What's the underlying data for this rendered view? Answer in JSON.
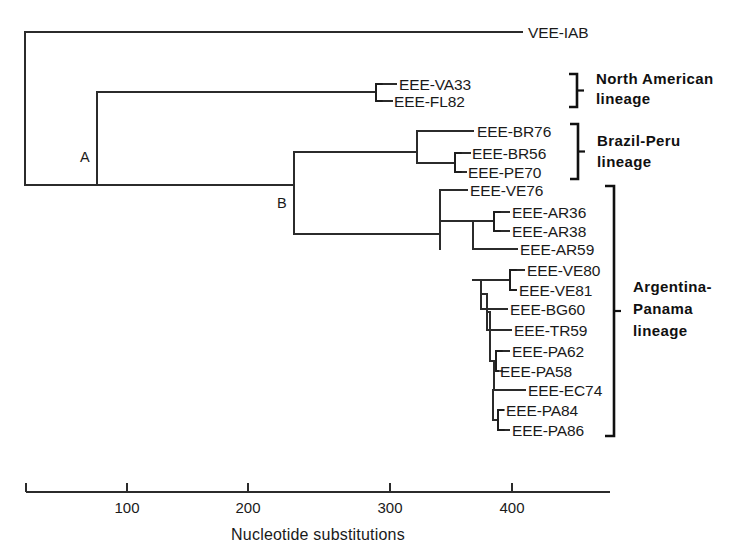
{
  "figure": {
    "kind": "phylogenetic-tree",
    "background_color": "#ffffff",
    "line_color": "#2b2b2b",
    "text_color": "#1a1a1a"
  },
  "chart_data": {
    "type": "tree",
    "title": "",
    "xlabel": "Nucleotide  substitutions",
    "ylabel": "",
    "grid": false,
    "legend_position": "right-brackets",
    "axis": {
      "ticks": [
        100,
        200,
        300,
        400
      ],
      "tick_labels": [
        "100",
        "200",
        "300",
        "400"
      ],
      "range": [
        0,
        470
      ],
      "units": "nucleotide substitutions"
    },
    "internal_node_labels": [
      "A",
      "B"
    ],
    "taxa": [
      "VEE-IAB",
      "EEE-VA33",
      "EEE-FL82",
      "EEE-BR76",
      "EEE-BR56",
      "EEE-PE70",
      "EEE-VE76",
      "EEE-AR36",
      "EEE-AR38",
      "EEE-AR59",
      "EEE-VE80",
      "EEE-VE81",
      "EEE-BG60",
      "EEE-TR59",
      "EEE-PA62",
      "EEE-PA58",
      "EEE-EC74",
      "EEE-PA84",
      "EEE-PA86"
    ],
    "groups": [
      {
        "name": "North American lineage",
        "members": [
          "EEE-VA33",
          "EEE-FL82"
        ]
      },
      {
        "name": "Brazil-Peru lineage",
        "members": [
          "EEE-BR76",
          "EEE-BR56",
          "EEE-PE70"
        ]
      },
      {
        "name": "Argentina-Panama lineage",
        "members": [
          "EEE-VE76",
          "EEE-AR36",
          "EEE-AR38",
          "EEE-AR59",
          "EEE-VE80",
          "EEE-VE81",
          "EEE-BG60",
          "EEE-TR59",
          "EEE-PA62",
          "EEE-PA58",
          "EEE-EC74",
          "EEE-PA84",
          "EEE-PA86"
        ]
      }
    ]
  },
  "tips": [
    {
      "id": "vee-iab",
      "label": "VEE-IAB",
      "label_x": 528,
      "y": 32,
      "branch_from": 25,
      "branch_to": 522
    },
    {
      "id": "eee-va33",
      "label": "EEE-VA33",
      "label_x": 399,
      "y": 84,
      "branch_from": 376,
      "branch_to": 396
    },
    {
      "id": "eee-fl82",
      "label": "EEE-FL82",
      "label_x": 394,
      "y": 101,
      "branch_from": 376,
      "branch_to": 392
    },
    {
      "id": "eee-br76",
      "label": "EEE-BR76",
      "label_x": 477,
      "y": 131,
      "branch_from": 417,
      "branch_to": 473
    },
    {
      "id": "eee-br56",
      "label": "EEE-BR56",
      "label_x": 472,
      "y": 153,
      "branch_from": 455,
      "branch_to": 470
    },
    {
      "id": "eee-pe70",
      "label": "EEE-PE70",
      "label_x": 468,
      "y": 172,
      "branch_from": 455,
      "branch_to": 466
    },
    {
      "id": "eee-ve76",
      "label": "EEE-VE76",
      "label_x": 470,
      "y": 190,
      "branch_from": 440,
      "branch_to": 467
    },
    {
      "id": "eee-ar36",
      "label": "EEE-AR36",
      "label_x": 512,
      "y": 212,
      "branch_from": 494,
      "branch_to": 509
    },
    {
      "id": "eee-ar38",
      "label": "EEE-AR38",
      "label_x": 512,
      "y": 231,
      "branch_from": 494,
      "branch_to": 509
    },
    {
      "id": "eee-ar59",
      "label": "EEE-AR59",
      "label_x": 520,
      "y": 249,
      "branch_from": 473,
      "branch_to": 517
    },
    {
      "id": "eee-ve80",
      "label": "EEE-VE80",
      "label_x": 527,
      "y": 270,
      "branch_from": 510,
      "branch_to": 524
    },
    {
      "id": "eee-ve81",
      "label": "EEE-VE81",
      "label_x": 519,
      "y": 290,
      "branch_from": 510,
      "branch_to": 516
    },
    {
      "id": "eee-bg60",
      "label": "EEE-BG60",
      "label_x": 510,
      "y": 309,
      "branch_from": 481,
      "branch_to": 507
    },
    {
      "id": "eee-tr59",
      "label": "EEE-TR59",
      "label_x": 514,
      "y": 330,
      "branch_from": 487,
      "branch_to": 511
    },
    {
      "id": "eee-pa62",
      "label": "EEE-PA62",
      "label_x": 512,
      "y": 351,
      "branch_from": 496,
      "branch_to": 509
    },
    {
      "id": "eee-pa58",
      "label": "EEE-PA58",
      "label_x": 500,
      "y": 371,
      "branch_from": 496,
      "branch_to": 498
    },
    {
      "id": "eee-ec74",
      "label": "EEE-EC74",
      "label_x": 528,
      "y": 390,
      "branch_from": 494,
      "branch_to": 525
    },
    {
      "id": "eee-pa84",
      "label": "EEE-PA84",
      "label_x": 506,
      "y": 410,
      "branch_from": 498,
      "branch_to": 503
    },
    {
      "id": "eee-pa86",
      "label": "EEE-PA86",
      "label_x": 512,
      "y": 430,
      "branch_from": 498,
      "branch_to": 509
    }
  ],
  "internal_nodes": [
    {
      "id": "root",
      "x": 25,
      "y_top": 32,
      "y_bottom": 185,
      "label": "",
      "label_x": 0,
      "label_y": 0
    },
    {
      "id": "node-a",
      "x": 97,
      "y_top": 92,
      "y_bottom": 185,
      "label": "A",
      "label_x": 80,
      "label_y": 162
    },
    {
      "id": "node-b",
      "x": 294,
      "y_top": 152,
      "y_bottom": 234,
      "label": "B",
      "label_x": 277,
      "label_y": 208
    },
    {
      "id": "node-na",
      "x": 376,
      "y_top": 84,
      "y_bottom": 101,
      "label": "",
      "label_x": 0,
      "label_y": 0
    },
    {
      "id": "node-bp",
      "x": 417,
      "y_top": 131,
      "y_bottom": 163,
      "label": "",
      "label_x": 0,
      "label_y": 0
    },
    {
      "id": "node-brpe",
      "x": 455,
      "y_top": 153,
      "y_bottom": 172,
      "label": "",
      "label_x": 0,
      "label_y": 0
    },
    {
      "id": "node-ap1",
      "x": 440,
      "y_top": 190,
      "y_bottom": 249,
      "label": "",
      "label_x": 0,
      "label_y": 0
    },
    {
      "id": "node-ap2",
      "x": 473,
      "y_top": 221,
      "y_bottom": 249,
      "label": "",
      "label_x": 0,
      "label_y": 0
    },
    {
      "id": "node-ar",
      "x": 494,
      "y_top": 212,
      "y_bottom": 231,
      "label": "",
      "label_x": 0,
      "label_y": 0
    },
    {
      "id": "node-ap3",
      "x": 481,
      "y_top": 280,
      "y_bottom": 309,
      "label": "",
      "label_x": 0,
      "label_y": 0
    },
    {
      "id": "node-ve",
      "x": 510,
      "y_top": 270,
      "y_bottom": 290,
      "label": "",
      "label_x": 0,
      "label_y": 0
    },
    {
      "id": "node-ap4",
      "x": 487,
      "y_top": 294,
      "y_bottom": 330,
      "label": "",
      "label_x": 0,
      "label_y": 0
    },
    {
      "id": "node-ap5",
      "x": 490,
      "y_top": 312,
      "y_bottom": 361,
      "label": "",
      "label_x": 0,
      "label_y": 0
    },
    {
      "id": "node-pa1",
      "x": 496,
      "y_top": 351,
      "y_bottom": 371,
      "label": "",
      "label_x": 0,
      "label_y": 0
    },
    {
      "id": "node-ap6",
      "x": 494,
      "y_top": 361,
      "y_bottom": 390,
      "label": "",
      "label_x": 0,
      "label_y": 0
    },
    {
      "id": "node-ap7",
      "x": 493,
      "y_top": 390,
      "y_bottom": 420,
      "label": "",
      "label_x": 0,
      "label_y": 0
    },
    {
      "id": "node-pa2",
      "x": 498,
      "y_top": 410,
      "y_bottom": 430,
      "label": "",
      "label_x": 0,
      "label_y": 0
    }
  ],
  "connectors": [
    {
      "id": "root-to-a",
      "x_from": 25,
      "x_to": 97,
      "y": 185
    },
    {
      "id": "a-to-na",
      "x_from": 97,
      "x_to": 376,
      "y": 92
    },
    {
      "id": "a-to-b",
      "x_from": 97,
      "x_to": 294,
      "y": 185
    },
    {
      "id": "b-to-bp",
      "x_from": 294,
      "x_to": 417,
      "y": 152
    },
    {
      "id": "bp-to-brpe",
      "x_from": 417,
      "x_to": 455,
      "y": 163
    },
    {
      "id": "b-to-ap1",
      "x_from": 294,
      "x_to": 440,
      "y": 234
    },
    {
      "id": "ap1-to-ap2",
      "x_from": 440,
      "x_to": 473,
      "y": 221
    },
    {
      "id": "ap2-to-ar",
      "x_from": 473,
      "x_to": 494,
      "y": 221
    },
    {
      "id": "ap2-to-ap3",
      "x_from": 473,
      "x_to": 481,
      "y": 280
    },
    {
      "id": "ap3-to-ve",
      "x_from": 481,
      "x_to": 510,
      "y": 280
    },
    {
      "id": "ap3-to-ap4",
      "x_from": 481,
      "x_to": 487,
      "y": 294
    },
    {
      "id": "ap4-to-ap5",
      "x_from": 487,
      "x_to": 490,
      "y": 312
    },
    {
      "id": "ap5-to-pa1",
      "x_from": 490,
      "x_to": 496,
      "y": 361
    },
    {
      "id": "pa1-to-ap6",
      "x_from": 494,
      "x_to": 496,
      "y": 361
    },
    {
      "id": "ap6-to-ap7",
      "x_from": 493,
      "x_to": 494,
      "y": 390
    },
    {
      "id": "ap7-to-pa2",
      "x_from": 493,
      "x_to": 498,
      "y": 420
    }
  ],
  "clade_brackets": [
    {
      "id": "bracket-na",
      "x": 376,
      "y_top": 84,
      "y_bottom": 101,
      "tick": 6
    },
    {
      "id": "bracket-brpe",
      "x": 455,
      "y_top": 153,
      "y_bottom": 172,
      "tick": 6
    },
    {
      "id": "bracket-ar",
      "x": 494,
      "y_top": 212,
      "y_bottom": 231,
      "tick": 6
    },
    {
      "id": "bracket-ve",
      "x": 510,
      "y_top": 270,
      "y_bottom": 290,
      "tick": 6
    },
    {
      "id": "bracket-pa62",
      "x": 496,
      "y_top": 351,
      "y_bottom": 371,
      "tick": 6
    },
    {
      "id": "bracket-pa84",
      "x": 498,
      "y_top": 410,
      "y_bottom": 430,
      "tick": 6
    }
  ],
  "group_brackets": [
    {
      "id": "group-north-american",
      "name": "North American lineage",
      "line1": "North  American",
      "line2": "lineage",
      "bracket_x": 577,
      "y_top": 74,
      "y_bottom": 107,
      "arm": 8,
      "tick": true,
      "label_x": 596,
      "label_y1": 84,
      "label_y2": 104
    },
    {
      "id": "group-brazil-peru",
      "name": "Brazil-Peru lineage",
      "line1": "Brazil-Peru",
      "line2": "lineage",
      "bracket_x": 578,
      "y_top": 124,
      "y_bottom": 179,
      "arm": 8,
      "tick": true,
      "label_x": 597,
      "label_y1": 146,
      "label_y2": 167
    },
    {
      "id": "group-argentina-panama",
      "name": "Argentina-Panama lineage",
      "line1": "Argentina-",
      "line2": "Panama",
      "line3": "lineage",
      "bracket_x": 614,
      "y_top": 186,
      "y_bottom": 436,
      "arm": 9,
      "tick": true,
      "label_x": 633,
      "label_y1": 292,
      "label_y2": 314,
      "label_y3": 336
    }
  ],
  "scale": {
    "id": "scale-bar",
    "axis_y": 492,
    "x_start": 26,
    "x_end": 610,
    "end_cap_height": 9,
    "tick_height": 9,
    "ticks": [
      {
        "value": "100",
        "x": 127
      },
      {
        "value": "200",
        "x": 248
      },
      {
        "value": "300",
        "x": 390
      },
      {
        "value": "400",
        "x": 512
      }
    ],
    "tick_label_y": 513,
    "title": "Nucleotide  substitutions",
    "title_x": 318,
    "title_y": 540
  }
}
